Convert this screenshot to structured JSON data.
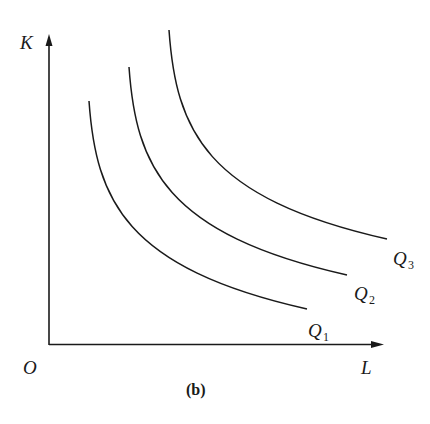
{
  "diagram": {
    "type": "isoquant map",
    "caption": "(b)",
    "axes": {
      "origin_label": "O",
      "x_label": "L",
      "y_label": "K"
    },
    "curves": [
      {
        "name": "Q",
        "subscript": "1",
        "label": "Q1"
      },
      {
        "name": "Q",
        "subscript": "2",
        "label": "Q2"
      },
      {
        "name": "Q",
        "subscript": "3",
        "label": "Q3"
      }
    ],
    "colors": {
      "line": "#1a1a1a",
      "background": "#ffffff"
    }
  }
}
